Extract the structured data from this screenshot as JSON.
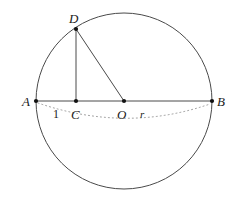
{
  "figure": {
    "type": "geometry-diagram",
    "background_color": "#ffffff",
    "stroke_color": "#3a3a3a",
    "label_color": "#1a1a1a",
    "dot_color": "#111111"
  },
  "circle": {
    "name": "main-circle",
    "cx": 124,
    "cy": 101,
    "r": 88,
    "stroke": "#4a4a4a",
    "stroke_width": 1
  },
  "points": [
    {
      "id": "A",
      "label": "A",
      "x": 36,
      "y": 101,
      "label_x": 22,
      "label_y": 106,
      "dot": true
    },
    {
      "id": "C",
      "label": "C",
      "x": 76,
      "y": 101,
      "label_x": 71,
      "label_y": 119,
      "dot": true
    },
    {
      "id": "O",
      "label": "O",
      "x": 124,
      "y": 101,
      "label_x": 117,
      "label_y": 119,
      "dot": true
    },
    {
      "id": "B",
      "label": "B",
      "x": 212,
      "y": 101,
      "label_x": 217,
      "label_y": 106,
      "dot": true
    },
    {
      "id": "D",
      "label": "D",
      "x": 76,
      "y": 29,
      "label_x": 69,
      "label_y": 23,
      "dot": true
    }
  ],
  "segments": [
    {
      "name": "diameter-AB",
      "from": "A",
      "to": "B",
      "x1": 36,
      "y1": 101,
      "x2": 212,
      "y2": 101,
      "style": "solid"
    },
    {
      "name": "segment-CD",
      "from": "C",
      "to": "D",
      "x1": 76,
      "y1": 101,
      "x2": 76,
      "y2": 29,
      "style": "solid"
    },
    {
      "name": "segment-DO",
      "from": "D",
      "to": "O",
      "x1": 76,
      "y1": 29,
      "x2": 124,
      "y2": 101,
      "style": "solid"
    }
  ],
  "dotted_arc": {
    "name": "measure-arc",
    "path": "M 38 103 Q 126 133 210 104",
    "stroke": "#9a9a9a",
    "stroke_width": 1,
    "dash": "1 3"
  },
  "measure_labels": [
    {
      "id": "len-1",
      "label": "1",
      "x": 53,
      "y": 118,
      "style": "upright"
    },
    {
      "id": "len-r",
      "label": "r",
      "x": 140,
      "y": 118,
      "style": "italic"
    }
  ]
}
